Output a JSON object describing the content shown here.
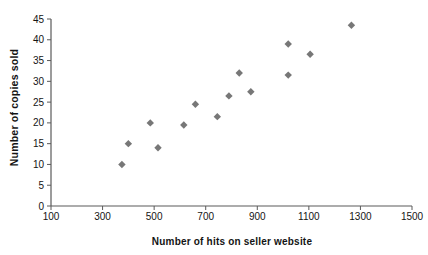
{
  "chart_data": {
    "type": "scatter",
    "title": "",
    "xlabel": "Number of hits on seller website",
    "ylabel": "Number of copies sold",
    "xlim": [
      100,
      1500
    ],
    "ylim": [
      0,
      45
    ],
    "xticks": [
      100,
      300,
      500,
      700,
      900,
      1100,
      1300,
      1500
    ],
    "yticks": [
      0,
      5,
      10,
      15,
      20,
      25,
      30,
      35,
      40,
      45
    ],
    "grid": false,
    "legend": false,
    "background": "#ffffff",
    "axis_color": "#5a5a5a",
    "label_color": "#141414",
    "marker": {
      "shape": "diamond",
      "color": "#777777",
      "size_px": 7.4
    },
    "points": [
      {
        "x": 375,
        "y": 10
      },
      {
        "x": 400,
        "y": 15
      },
      {
        "x": 485,
        "y": 20
      },
      {
        "x": 515,
        "y": 14
      },
      {
        "x": 615,
        "y": 19.5
      },
      {
        "x": 660,
        "y": 24.5
      },
      {
        "x": 745,
        "y": 21.5
      },
      {
        "x": 790,
        "y": 26.5
      },
      {
        "x": 830,
        "y": 32
      },
      {
        "x": 875,
        "y": 27.5
      },
      {
        "x": 1020,
        "y": 31.5
      },
      {
        "x": 1020,
        "y": 39
      },
      {
        "x": 1105,
        "y": 36.5
      },
      {
        "x": 1265,
        "y": 43.5
      }
    ]
  }
}
